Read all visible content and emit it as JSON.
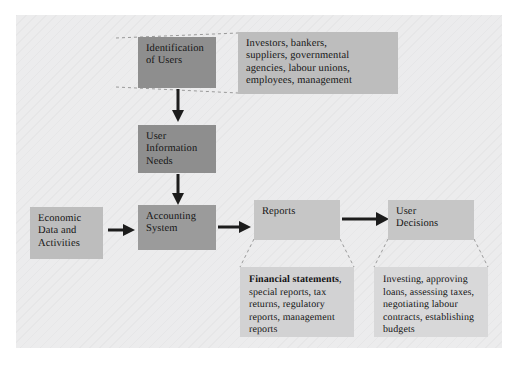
{
  "diagram": {
    "background_color": "#ececed",
    "page_color": "#ffffff",
    "nodes": {
      "identification_of_users": {
        "label": "Identification\nof Users",
        "color": "#8e8e8e"
      },
      "users_callout": {
        "label": "Investors, bankers,\nsuppliers, governmental\nagencies, labour unions,\nemployees, management",
        "color": "#bdbdbd"
      },
      "user_information_needs": {
        "label": "User\nInformation\nNeeds",
        "color": "#8e8e8e"
      },
      "economic_data_and_activities": {
        "label": "Economic\nData and\nActivities",
        "color": "#bdbdbd"
      },
      "accounting_system": {
        "label": "Accounting\nSystem",
        "color": "#9b9b9b"
      },
      "reports": {
        "label": "Reports",
        "color": "#c6c6c6"
      },
      "user_decisions": {
        "label": "User\nDecisions",
        "color": "#c6c6c6"
      },
      "reports_callout": {
        "label_bold": "Financial statements",
        "label_rest": ", special reports, tax returns, regulatory reports, management reports",
        "color": "#d2d2d3"
      },
      "decisions_callout": {
        "label": "Investing, approving loans, assessing taxes, negotiating labour contracts, establishing budgets",
        "color": "#d8d8d9"
      }
    },
    "arrows": {
      "identification_to_needs": "down-arrow",
      "needs_to_accounting": "down-arrow",
      "economic_to_accounting": "right-arrow",
      "accounting_to_reports": "right-arrow",
      "reports_to_decisions": "right-arrow"
    },
    "arrow_color": "#1c1c1c",
    "connector_style": "dashed"
  }
}
